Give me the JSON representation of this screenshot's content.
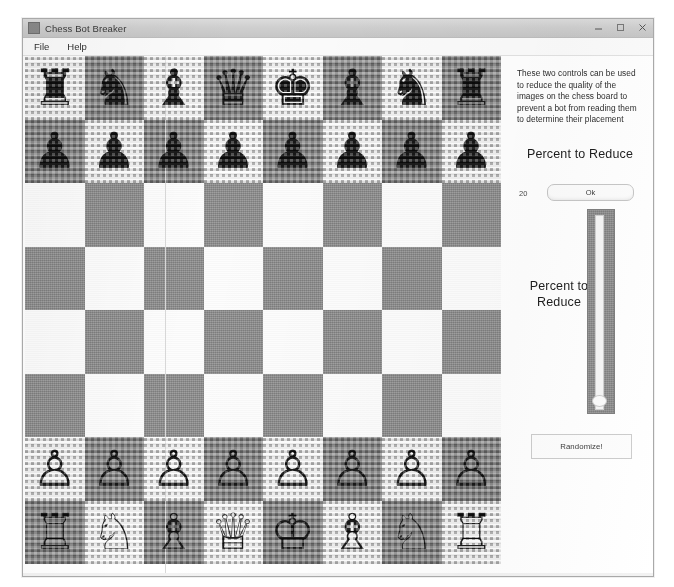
{
  "window": {
    "title": "Chess Bot Breaker",
    "app_icon": "chess-app-icon",
    "controls": [
      {
        "name": "minimize",
        "glyph": "minimize-icon"
      },
      {
        "name": "maximize",
        "glyph": "maximize-icon"
      },
      {
        "name": "close",
        "glyph": "close-icon"
      }
    ]
  },
  "menubar": {
    "items": [
      {
        "label": "File",
        "name": "menu-file"
      },
      {
        "label": "Help",
        "name": "menu-help"
      }
    ]
  },
  "panel": {
    "description": "These two controls can be used to reduce the quality of the images on the chess board to prevent a bot from reading them to determine their placement",
    "label_top": "Percent to Reduce",
    "label_slider": "Percent to Reduce",
    "value_readout": "20",
    "ok_label": "Ok",
    "randomize_label": "Randomize!",
    "slider": {
      "orientation": "vertical",
      "thumb_position_percent": 4,
      "track_color": "#f5f5f5",
      "body_color": "#8d8d8d"
    }
  },
  "board": {
    "size": 8,
    "light_color": "#fdfdfd",
    "dark_color": "#8e8e8e",
    "quality_reduced": true,
    "rows": [
      [
        "rook-black",
        "knight-black",
        "bishop-black",
        "queen-black",
        "king-black",
        "bishop-black",
        "knight-black",
        "rook-black"
      ],
      [
        "pawn-black",
        "pawn-black",
        "pawn-black",
        "pawn-black",
        "pawn-black",
        "pawn-black",
        "pawn-black",
        "pawn-black"
      ],
      [
        "",
        "",
        "",
        "",
        "",
        "",
        "",
        ""
      ],
      [
        "",
        "",
        "",
        "",
        "",
        "",
        "",
        ""
      ],
      [
        "",
        "",
        "",
        "",
        "",
        "",
        "",
        ""
      ],
      [
        "",
        "",
        "",
        "",
        "",
        "",
        "",
        ""
      ],
      [
        "pawn-white",
        "pawn-white",
        "pawn-white",
        "pawn-white",
        "pawn-white",
        "pawn-white",
        "pawn-white",
        "pawn-white"
      ],
      [
        "rook-white",
        "knight-white",
        "bishop-white",
        "queen-white",
        "king-white",
        "bishop-white",
        "knight-white",
        "rook-white"
      ]
    ],
    "glyphs": {
      "rook-black": "♜",
      "knight-black": "♞",
      "bishop-black": "♝",
      "queen-black": "♛",
      "king-black": "♚",
      "pawn-black": "♟",
      "rook-white": "♖",
      "knight-white": "♘",
      "bishop-white": "♗",
      "queen-white": "♕",
      "king-white": "♔",
      "pawn-white": "♙"
    }
  }
}
